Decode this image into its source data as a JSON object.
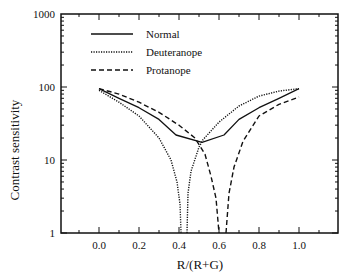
{
  "chart_data": {
    "type": "line",
    "title": "",
    "xlabel": "R/(R+G)",
    "ylabel": "Contrast sensitivity",
    "xscale": "linear",
    "yscale": "log",
    "xlim": [
      -0.2,
      1.2
    ],
    "ylim": [
      1,
      1000
    ],
    "x_ticks": [
      "0.0",
      "0.2",
      "0.4",
      "0.6",
      "0.8",
      "1.0"
    ],
    "x_tick_values": [
      0.0,
      0.2,
      0.4,
      0.6,
      0.8,
      1.0
    ],
    "y_ticks": [
      "1",
      "10",
      "100",
      "1000"
    ],
    "y_tick_values": [
      1,
      10,
      100,
      1000
    ],
    "grid": false,
    "legend_position": "upper-left (inside)",
    "series": [
      {
        "name": "Normal",
        "style": "solid",
        "x": [
          0.0,
          0.1,
          0.2,
          0.3,
          0.385,
          0.515,
          0.625,
          0.7,
          0.8,
          0.9,
          1.0
        ],
        "y": [
          95,
          70,
          52,
          36,
          22,
          17.5,
          22,
          36,
          52,
          70,
          95
        ]
      },
      {
        "name": "Deuteranope",
        "style": "dotted",
        "x": [
          0.0,
          0.1,
          0.2,
          0.3,
          0.36,
          0.39,
          0.405,
          0.41,
          null,
          0.44,
          0.445,
          0.46,
          0.5,
          0.52,
          0.6,
          0.7,
          0.8,
          0.9,
          1.0
        ],
        "y": [
          90,
          62,
          40,
          20,
          10,
          5,
          2.5,
          1,
          null,
          1,
          3.5,
          7,
          15,
          19,
          33,
          55,
          75,
          88,
          95
        ]
      },
      {
        "name": "Protanope",
        "style": "dashed",
        "x": [
          0.0,
          0.1,
          0.2,
          0.3,
          0.4,
          0.48,
          0.53,
          0.56,
          0.585,
          0.6,
          null,
          0.635,
          0.65,
          0.675,
          0.72,
          0.8,
          0.9,
          1.0
        ],
        "y": [
          95,
          80,
          62,
          45,
          30,
          20,
          12,
          6,
          3,
          1,
          null,
          1,
          3.5,
          8,
          18,
          40,
          58,
          73
        ]
      }
    ],
    "legend": [
      "Normal",
      "Deuteranope",
      "Protanope"
    ]
  }
}
